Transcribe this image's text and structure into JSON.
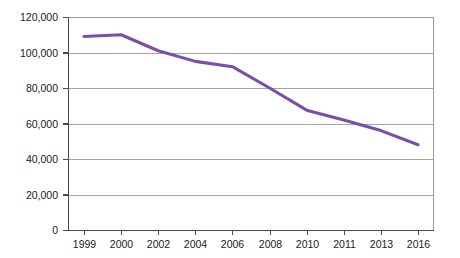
{
  "chart_data": {
    "type": "line",
    "title": "",
    "subtitle": "",
    "xlabel": "",
    "ylabel": "",
    "categories": [
      "1999",
      "2000",
      "2002",
      "2004",
      "2006",
      "2008",
      "2010",
      "2011",
      "2013",
      "2016"
    ],
    "x": [
      1999,
      2000,
      2002,
      2004,
      2006,
      2008,
      2010,
      2011,
      2013,
      2016
    ],
    "values": [
      109000,
      110000,
      101000,
      95000,
      92000,
      80000,
      67500,
      62000,
      56000,
      48000
    ],
    "series": [
      {
        "name": "",
        "color": "#7b4fa8",
        "values": [
          109000,
          110000,
          101000,
          95000,
          92000,
          80000,
          67500,
          62000,
          56000,
          48000
        ]
      }
    ],
    "ylim": [
      0,
      120000
    ],
    "yticks": [
      0,
      20000,
      40000,
      60000,
      80000,
      100000,
      120000
    ],
    "ytick_labels": [
      "0",
      "20,000",
      "40,000",
      "60,000",
      "80,000",
      "100,000",
      "120,000"
    ],
    "xtick_labels": [
      "1999",
      "2000",
      "2002",
      "2004",
      "2006",
      "2008",
      "2010",
      "2011",
      "2013",
      "2016"
    ],
    "grid": true,
    "grid_axis": "y",
    "legend": false,
    "legend_position": "none",
    "annotations": []
  },
  "style": {
    "line_color": "#7b4fa8",
    "grid_color": "#9a9a9a",
    "axis_color": "#4a4a4a",
    "text_color": "#1a1a1a",
    "background": "#ffffff"
  }
}
